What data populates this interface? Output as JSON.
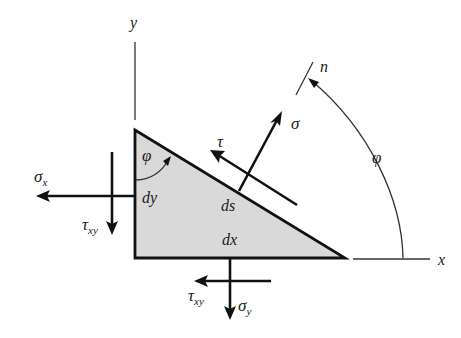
{
  "figure": {
    "type": "stress-element-free-body-diagram",
    "colors": {
      "background": "#ffffff",
      "ink": "#111111",
      "element_fill": "#d9d9d9"
    },
    "axes": {
      "y_label": "y",
      "x_label": "x",
      "n_label": "n"
    },
    "element": {
      "shape": "right-triangle",
      "vertical_side_label": "dy",
      "horizontal_side_label": "dx",
      "hypotenuse_label": "ds",
      "interior_angle_label": "φ"
    },
    "rotation_arc": {
      "label": "φ",
      "from_axis": "x",
      "to_axis": "n"
    },
    "stresses": {
      "left_face_normal": {
        "symbol": "σ",
        "subscript": "x"
      },
      "left_face_shear": {
        "symbol": "τ",
        "subscript": "xy"
      },
      "bottom_face_normal": {
        "symbol": "σ",
        "subscript": "y"
      },
      "bottom_face_shear": {
        "symbol": "τ",
        "subscript": "xy"
      },
      "inclined_face_normal": {
        "symbol": "σ",
        "subscript": ""
      },
      "inclined_face_shear": {
        "symbol": "τ",
        "subscript": ""
      }
    }
  }
}
